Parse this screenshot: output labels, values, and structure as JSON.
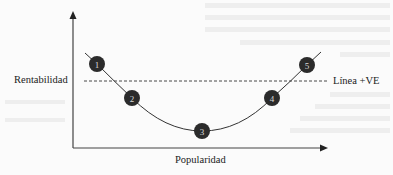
{
  "diagram": {
    "y_axis_label": "Rentabilidad",
    "x_axis_label": "Popularidad",
    "threshold_line_label": "Línea +VE",
    "colors": {
      "axis": "#444444",
      "curve": "#333333",
      "marker_fill": "#2b2b2b",
      "marker_text": "#d9d9d9",
      "label_text": "#222222"
    },
    "points": [
      {
        "label": "1",
        "x": 97,
        "y": 64
      },
      {
        "label": "2",
        "x": 132,
        "y": 98
      },
      {
        "label": "3",
        "x": 202,
        "y": 131
      },
      {
        "label": "4",
        "x": 272,
        "y": 98
      },
      {
        "label": "5",
        "x": 307,
        "y": 65
      }
    ]
  }
}
